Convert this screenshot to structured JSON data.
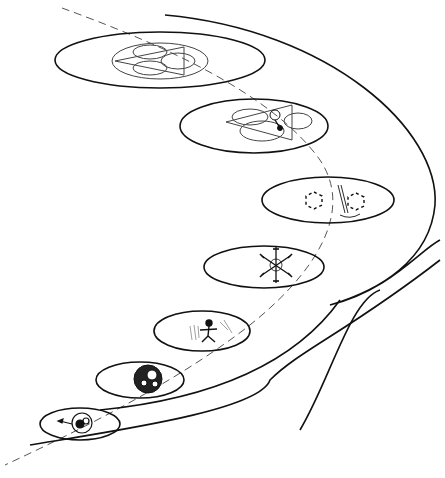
{
  "diagram": {
    "type": "spiral-of-levels",
    "colors": {
      "stroke": "#111111",
      "background": "#ffffff",
      "axis": "#555555"
    },
    "levels": [
      {
        "index": 1,
        "icon": "atom-particles-icon"
      },
      {
        "index": 2,
        "icon": "cell-cluster-icon"
      },
      {
        "index": 3,
        "icon": "human-figure-icon"
      },
      {
        "index": 4,
        "icon": "snowflake-molecule-icon"
      },
      {
        "index": 5,
        "icon": "hexagonal-molecules-icon"
      },
      {
        "index": 6,
        "icon": "triangle-circles-figure-icon"
      },
      {
        "index": 7,
        "icon": "triangle-three-circles-icon"
      }
    ]
  }
}
